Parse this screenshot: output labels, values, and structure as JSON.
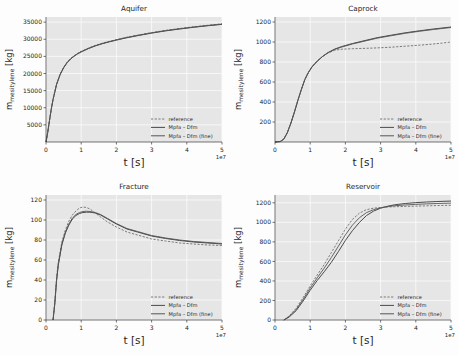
{
  "figure": {
    "background_color": "#fdfdfd",
    "axes_background_color": "#e6e6e6",
    "grid_color": "#fbfbfb"
  },
  "common": {
    "xlabel": "t [s]",
    "x_exponent": "1e7",
    "ylabel_main": "m",
    "ylabel_sub": "mesitylene",
    "ylabel_unit": " [kg]",
    "xticks": [
      "0",
      "1",
      "2",
      "3",
      "4",
      "5"
    ],
    "legend": [
      {
        "label": "reference",
        "style": "dashed",
        "color": "#6d6d6d"
      },
      {
        "label": "Mpfa – Dfm",
        "style": "solid",
        "color": "#4a4a4a"
      },
      {
        "label": "Mpfa – Dfm (fine)",
        "style": "solid",
        "color": "#565656"
      }
    ]
  },
  "chart_data": [
    {
      "type": "line",
      "title": "Aquifer",
      "xlabel": "t [s]",
      "ylabel": "m_mesitylene [kg]",
      "xlim": [
        0,
        5
      ],
      "ylim": [
        0,
        36500
      ],
      "x_exponent": "1e7",
      "grid": true,
      "legend_position": "lower right",
      "yticks": [
        5000,
        10000,
        15000,
        20000,
        25000,
        30000,
        35000
      ],
      "ytick_labels": [
        "5000",
        "10000",
        "15000",
        "20000",
        "25000",
        "30000",
        "35000"
      ],
      "xticks": [
        0,
        1,
        2,
        3,
        4,
        5
      ],
      "x": [
        0.0,
        0.05,
        0.1,
        0.15,
        0.2,
        0.3,
        0.4,
        0.5,
        0.6,
        0.7,
        0.8,
        0.9,
        1.0,
        1.2,
        1.4,
        1.6,
        1.8,
        2.0,
        2.3,
        2.6,
        3.0,
        3.4,
        3.8,
        4.2,
        4.6,
        5.0
      ],
      "series": [
        {
          "name": "reference",
          "values": [
            0,
            2900,
            6400,
            9700,
            12500,
            16900,
            19800,
            21800,
            23300,
            24400,
            25200,
            25900,
            26450,
            27400,
            28200,
            28850,
            29400,
            29900,
            30600,
            31200,
            31950,
            32600,
            33150,
            33650,
            34100,
            34500
          ]
        },
        {
          "name": "Mpfa – Dfm",
          "values": [
            0,
            2850,
            6300,
            9550,
            12350,
            16750,
            19650,
            21650,
            23150,
            24250,
            25050,
            25750,
            26300,
            27250,
            28050,
            28700,
            29250,
            29750,
            30450,
            31050,
            31800,
            32450,
            33000,
            33500,
            33950,
            34350
          ]
        },
        {
          "name": "Mpfa – Dfm (fine)",
          "values": [
            0,
            2875,
            6350,
            9620,
            12420,
            16820,
            19720,
            21720,
            23220,
            24320,
            25120,
            25820,
            26370,
            27320,
            28120,
            28770,
            29320,
            29820,
            30520,
            31120,
            31870,
            32520,
            33070,
            33570,
            34020,
            34420
          ]
        }
      ]
    },
    {
      "type": "line",
      "title": "Caprock",
      "xlabel": "t [s]",
      "ylabel": "m_mesitylene [kg]",
      "xlim": [
        0,
        5
      ],
      "ylim": [
        0,
        1250
      ],
      "x_exponent": "1e7",
      "grid": true,
      "legend_position": "lower right",
      "yticks": [
        200,
        400,
        600,
        800,
        1000,
        1200
      ],
      "ytick_labels": [
        "200",
        "400",
        "600",
        "800",
        "1000",
        "1200"
      ],
      "xticks": [
        0,
        1,
        2,
        3,
        4,
        5
      ],
      "x": [
        0.0,
        0.15,
        0.25,
        0.35,
        0.45,
        0.55,
        0.65,
        0.75,
        0.85,
        0.95,
        1.05,
        1.2,
        1.35,
        1.5,
        1.7,
        1.9,
        2.2,
        2.5,
        2.9,
        3.3,
        3.7,
        4.1,
        4.5,
        5.0
      ],
      "series": [
        {
          "name": "reference",
          "values": [
            0,
            5,
            30,
            95,
            190,
            300,
            420,
            530,
            630,
            700,
            755,
            810,
            855,
            890,
            918,
            928,
            933,
            936,
            941,
            948,
            958,
            968,
            980,
            1000
          ]
        },
        {
          "name": "Mpfa – Dfm",
          "values": [
            0,
            5,
            28,
            92,
            186,
            295,
            415,
            525,
            625,
            695,
            750,
            808,
            855,
            893,
            930,
            955,
            985,
            1010,
            1043,
            1068,
            1092,
            1112,
            1130,
            1150
          ]
        },
        {
          "name": "Mpfa – Dfm (fine)",
          "values": [
            0,
            5,
            29,
            93,
            188,
            297,
            417,
            527,
            627,
            697,
            752,
            809,
            855,
            891,
            926,
            950,
            980,
            1005,
            1038,
            1063,
            1087,
            1107,
            1125,
            1145
          ]
        }
      ]
    },
    {
      "type": "line",
      "title": "Fracture",
      "xlabel": "t [s]",
      "ylabel": "m_mesitylene [kg]",
      "xlim": [
        0,
        5
      ],
      "ylim": [
        0,
        125
      ],
      "x_exponent": "1e7",
      "grid": true,
      "legend_position": "lower right",
      "yticks": [
        0,
        20,
        40,
        60,
        80,
        100,
        120
      ],
      "ytick_labels": [
        "0",
        "20",
        "40",
        "60",
        "80",
        "100",
        "120"
      ],
      "xticks": [
        0,
        1,
        2,
        3,
        4,
        5
      ],
      "x": [
        0.2,
        0.25,
        0.3,
        0.35,
        0.45,
        0.55,
        0.65,
        0.75,
        0.85,
        0.95,
        1.05,
        1.15,
        1.25,
        1.4,
        1.55,
        1.75,
        2.0,
        2.3,
        2.6,
        3.0,
        3.4,
        3.8,
        4.2,
        4.6,
        5.0
      ],
      "series": [
        {
          "name": "reference",
          "values": [
            0,
            18,
            42,
            58,
            78,
            90,
            99,
            105,
            109,
            112,
            113,
            112.5,
            111,
            107,
            103,
            98,
            93,
            88,
            85,
            81,
            79,
            77,
            76,
            75,
            74.5
          ]
        },
        {
          "name": "Mpfa – Dfm",
          "values": [
            0,
            16,
            39,
            55,
            75,
            87,
            95,
            101,
            104.5,
            106.5,
            107.5,
            107.8,
            107.8,
            107,
            105,
            101,
            96,
            91,
            88,
            84,
            81.5,
            79.5,
            78,
            77,
            76
          ]
        },
        {
          "name": "Mpfa – Dfm (fine)",
          "values": [
            0,
            17,
            40,
            56,
            76,
            88,
            96,
            102,
            105.5,
            107.5,
            108.5,
            108.8,
            108.5,
            107.5,
            105.5,
            101.5,
            96.5,
            91.5,
            88.5,
            84.5,
            82,
            80,
            78.5,
            77.5,
            76.5
          ]
        }
      ]
    },
    {
      "type": "line",
      "title": "Reservoir",
      "xlabel": "t [s]",
      "ylabel": "m_mesitylene [kg]",
      "xlim": [
        0,
        5
      ],
      "ylim": [
        0,
        1280
      ],
      "x_exponent": "1e7",
      "grid": true,
      "legend_position": "lower right",
      "yticks": [
        0,
        200,
        400,
        600,
        800,
        1000,
        1200
      ],
      "ytick_labels": [
        "0",
        "200",
        "400",
        "600",
        "800",
        "1000",
        "1200"
      ],
      "xticks": [
        0,
        1,
        2,
        3,
        4,
        5
      ],
      "x": [
        0.25,
        0.4,
        0.6,
        0.8,
        1.0,
        1.2,
        1.4,
        1.6,
        1.8,
        2.0,
        2.2,
        2.4,
        2.6,
        2.8,
        3.0,
        3.2,
        3.4,
        3.7,
        4.0,
        4.3,
        4.6,
        5.0
      ],
      "series": [
        {
          "name": "reference",
          "values": [
            0,
            40,
            120,
            230,
            350,
            460,
            570,
            690,
            810,
            930,
            1030,
            1095,
            1130,
            1145,
            1152,
            1157,
            1160,
            1163,
            1166,
            1169,
            1172,
            1175
          ]
        },
        {
          "name": "Mpfa – Dfm",
          "values": [
            0,
            30,
            95,
            195,
            305,
            405,
            495,
            590,
            700,
            815,
            915,
            1000,
            1070,
            1115,
            1145,
            1165,
            1180,
            1193,
            1202,
            1208,
            1213,
            1218
          ]
        },
        {
          "name": "Mpfa – Dfm (fine)",
          "values": [
            0,
            35,
            108,
            212,
            327,
            432,
            532,
            640,
            755,
            872,
            972,
            1048,
            1100,
            1130,
            1148,
            1161,
            1170,
            1178,
            1184,
            1189,
            1193,
            1197
          ]
        }
      ]
    }
  ]
}
